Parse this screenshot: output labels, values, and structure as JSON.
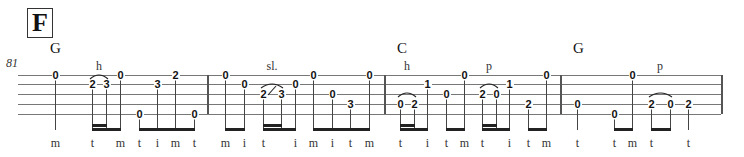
{
  "section": {
    "label": "F"
  },
  "measure_number": "81",
  "chords": [
    {
      "label": "G",
      "x": 50
    },
    {
      "label": "C",
      "x": 397
    },
    {
      "label": "G",
      "x": 573
    }
  ],
  "staff": {
    "lines_y": [
      75,
      84,
      94,
      104,
      114
    ],
    "left": 18,
    "right": 721
  },
  "barlines_x": [
    207,
    384,
    560
  ],
  "notes": [
    {
      "fret": "0",
      "string": 1,
      "x": 55,
      "finger": "m"
    },
    {
      "fret": "2",
      "string": 2,
      "x": 92,
      "finger": "t"
    },
    {
      "fret": "3",
      "string": 2,
      "x": 106,
      "finger": ""
    },
    {
      "fret": "0",
      "string": 1,
      "x": 120,
      "finger": "m"
    },
    {
      "fret": "0",
      "string": 5,
      "x": 139,
      "finger": "t"
    },
    {
      "fret": "3",
      "string": 2,
      "x": 157,
      "finger": "i"
    },
    {
      "fret": "2",
      "string": 1,
      "x": 175,
      "finger": "m"
    },
    {
      "fret": "0",
      "string": 5,
      "x": 194,
      "finger": "t"
    },
    {
      "fret": "0",
      "string": 1,
      "x": 225,
      "finger": "m"
    },
    {
      "fret": "0",
      "string": 2,
      "x": 244,
      "finger": "i"
    },
    {
      "fret": "2",
      "string": 3,
      "x": 263,
      "finger": "t"
    },
    {
      "fret": "3",
      "string": 3,
      "x": 281,
      "finger": ""
    },
    {
      "fret": "0",
      "string": 2,
      "x": 295,
      "finger": "i"
    },
    {
      "fret": "0",
      "string": 1,
      "x": 313,
      "finger": "m"
    },
    {
      "fret": "0",
      "string": 3,
      "x": 332,
      "finger": "i"
    },
    {
      "fret": "3",
      "string": 4,
      "x": 350,
      "finger": "t"
    },
    {
      "fret": "0",
      "string": 1,
      "x": 369,
      "finger": "m"
    },
    {
      "fret": "0",
      "string": 4,
      "x": 400,
      "finger": "t"
    },
    {
      "fret": "2",
      "string": 4,
      "x": 414,
      "finger": ""
    },
    {
      "fret": "1",
      "string": 2,
      "x": 427,
      "finger": "i"
    },
    {
      "fret": "0",
      "string": 3,
      "x": 446,
      "finger": "t"
    },
    {
      "fret": "0",
      "string": 1,
      "x": 464,
      "finger": "m"
    },
    {
      "fret": "2",
      "string": 3,
      "x": 482,
      "finger": "t"
    },
    {
      "fret": "0",
      "string": 3,
      "x": 496,
      "finger": ""
    },
    {
      "fret": "1",
      "string": 2,
      "x": 509,
      "finger": "i"
    },
    {
      "fret": "2",
      "string": 4,
      "x": 528,
      "finger": "t"
    },
    {
      "fret": "0",
      "string": 1,
      "x": 546,
      "finger": "m"
    },
    {
      "fret": "0",
      "string": 4,
      "x": 577,
      "finger": "t"
    },
    {
      "fret": "0",
      "string": 5,
      "x": 614,
      "finger": "t"
    },
    {
      "fret": "0",
      "string": 1,
      "x": 632,
      "finger": "m"
    },
    {
      "fret": "2",
      "string": 4,
      "x": 651,
      "finger": "t"
    },
    {
      "fret": "0",
      "string": 4,
      "x": 670,
      "finger": ""
    },
    {
      "fret": "2",
      "string": 4,
      "x": 688,
      "finger": "t"
    }
  ],
  "beams": [
    {
      "x1": 92,
      "x2": 120,
      "y": 128
    },
    {
      "x1": 92,
      "x2": 106,
      "y": 124
    },
    {
      "x1": 139,
      "x2": 194,
      "y": 128
    },
    {
      "x1": 225,
      "x2": 244,
      "y": 128
    },
    {
      "x1": 263,
      "x2": 295,
      "y": 128
    },
    {
      "x1": 263,
      "x2": 281,
      "y": 124
    },
    {
      "x1": 313,
      "x2": 369,
      "y": 128
    },
    {
      "x1": 400,
      "x2": 427,
      "y": 128
    },
    {
      "x1": 400,
      "x2": 414,
      "y": 124
    },
    {
      "x1": 446,
      "x2": 464,
      "y": 128
    },
    {
      "x1": 482,
      "x2": 509,
      "y": 128
    },
    {
      "x1": 482,
      "x2": 496,
      "y": 124
    },
    {
      "x1": 528,
      "x2": 546,
      "y": 128
    },
    {
      "x1": 614,
      "x2": 632,
      "y": 128
    },
    {
      "x1": 651,
      "x2": 670,
      "y": 128
    }
  ],
  "techniques": [
    {
      "label": "h",
      "x": 99,
      "y": 59,
      "arc": [
        92,
        106,
        81
      ]
    },
    {
      "label": "sl.",
      "x": 272,
      "y": 59,
      "arc": [
        263,
        281,
        90
      ],
      "slide": true
    },
    {
      "label": "h",
      "x": 407,
      "y": 59,
      "arc": [
        400,
        414,
        99
      ]
    },
    {
      "label": "p",
      "x": 489,
      "y": 59,
      "arc": [
        482,
        496,
        90
      ]
    },
    {
      "label": "p",
      "x": 660,
      "y": 59,
      "arc": [
        651,
        670,
        99
      ]
    }
  ]
}
